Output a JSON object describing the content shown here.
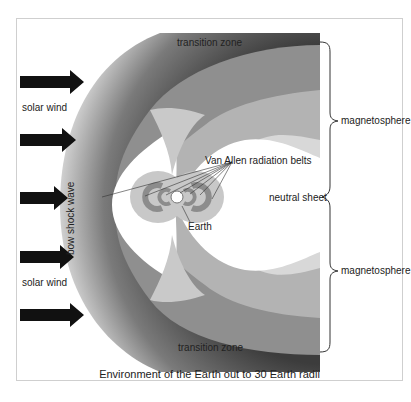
{
  "diagram": {
    "caption": "Environment of the Earth out to 30 Earth radii",
    "labels": {
      "transition_zone_top": "transition zone",
      "transition_zone_bottom": "transition zone",
      "solar_wind_top": "solar wind",
      "solar_wind_bottom": "solar wind",
      "bow_shock_wave": "bow shock wave",
      "van_allen": "Van Allen radiation belts",
      "earth": "Earth",
      "neutral_sheet": "neutral sheet",
      "magnetosphere_top": "magnetosphere",
      "magnetosphere_bottom": "magnetosphere"
    },
    "arrows_count": 5,
    "colors": {
      "shock_dark": "#4a4a4a",
      "shock_light": "#e6e6e6",
      "outer_band": "#8e8e8e",
      "middle_band": "#b0b0b0",
      "inner_band": "#d6d6d6",
      "cavity": "#ffffff",
      "belts": "#9c9c9c",
      "arrow": "#111111"
    }
  }
}
